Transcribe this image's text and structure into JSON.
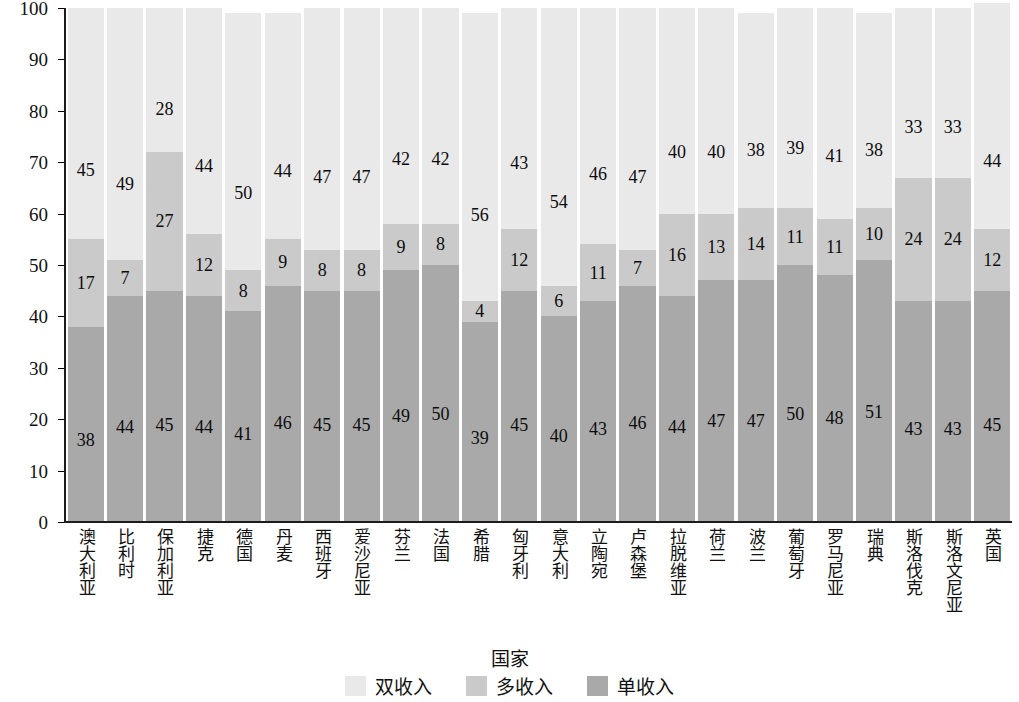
{
  "chart_data": {
    "type": "bar",
    "subtype": "stacked-bar-100",
    "title": "",
    "xlabel": "国家",
    "ylabel": "家庭构成占比/%",
    "ylim": [
      0,
      100
    ],
    "yticks": [
      0,
      10,
      20,
      30,
      40,
      50,
      60,
      70,
      80,
      90,
      100
    ],
    "grid": false,
    "legend_position": "bottom",
    "categories": [
      "澳大利亚",
      "比利时",
      "保加利亚",
      "捷克",
      "德国",
      "丹麦",
      "西班牙",
      "爱沙尼亚",
      "芬兰",
      "法国",
      "希腊",
      "匈牙利",
      "意大利",
      "立陶宛",
      "卢森堡",
      "拉脱维亚",
      "荷兰",
      "波兰",
      "葡萄牙",
      "罗马尼亚",
      "瑞典",
      "斯洛伐克",
      "斯洛文尼亚",
      "英国"
    ],
    "series": [
      {
        "name": "单收入",
        "color": "#a9a9a9",
        "stack_order": 0,
        "values": [
          38,
          44,
          45,
          44,
          41,
          46,
          45,
          45,
          49,
          50,
          39,
          45,
          40,
          43,
          46,
          44,
          47,
          47,
          50,
          48,
          51,
          43,
          43,
          45
        ]
      },
      {
        "name": "多收入",
        "color": "#cacaca",
        "stack_order": 1,
        "values": [
          17,
          7,
          27,
          12,
          8,
          9,
          8,
          8,
          9,
          8,
          4,
          12,
          6,
          11,
          7,
          16,
          13,
          14,
          11,
          11,
          10,
          24,
          24,
          12
        ]
      },
      {
        "name": "双收入",
        "color": "#e9e9e9",
        "stack_order": 2,
        "values": [
          45,
          49,
          28,
          44,
          50,
          44,
          47,
          47,
          42,
          42,
          56,
          43,
          54,
          46,
          47,
          40,
          40,
          38,
          39,
          41,
          38,
          33,
          33,
          44
        ]
      }
    ],
    "legend": [
      "双收入",
      "多收入",
      "单收入"
    ],
    "legend_colors": [
      "#e9e9e9",
      "#cacaca",
      "#a9a9a9"
    ]
  }
}
